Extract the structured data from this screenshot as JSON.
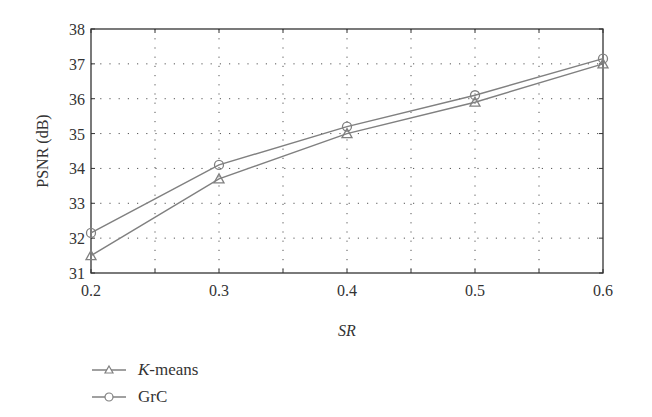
{
  "chart_data": {
    "type": "line",
    "title": "",
    "xlabel": "SR",
    "ylabel": "PSNR (dB)",
    "x": [
      0.2,
      0.3,
      0.4,
      0.5,
      0.6
    ],
    "x_tick_labels": [
      "0.2",
      "0.3",
      "0.4",
      "0.5",
      "0.6"
    ],
    "y_tick_labels": [
      "31",
      "32",
      "33",
      "34",
      "35",
      "36",
      "37",
      "38"
    ],
    "xlim": [
      0.2,
      0.6
    ],
    "ylim": [
      31,
      38
    ],
    "grid": true,
    "legend_position": "below-left",
    "series": [
      {
        "name": "K-means",
        "marker": "triangle",
        "values": [
          31.5,
          33.7,
          35.0,
          35.9,
          37.0
        ],
        "color": "#808080"
      },
      {
        "name": "GrC",
        "marker": "circle",
        "values": [
          32.15,
          34.1,
          35.2,
          36.1,
          37.15
        ],
        "color": "#808080"
      }
    ]
  },
  "legend": {
    "kmeans_italic": "K",
    "kmeans_rest": "-means",
    "grc": "GrC"
  },
  "axes": {
    "xlabel": "SR",
    "ylabel": "PSNR (dB)"
  }
}
